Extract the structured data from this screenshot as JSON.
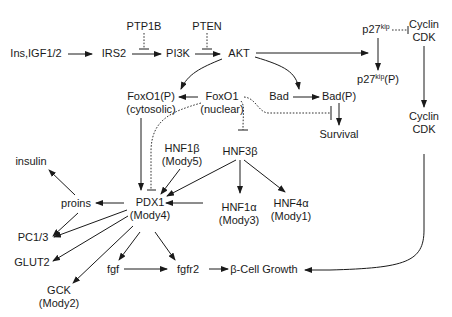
{
  "diagram": {
    "type": "signaling-pathway",
    "nodes": {
      "ins": "Ins,IGF1/2",
      "irs2": "IRS2",
      "ptp1b": "PTP1B",
      "pi3k": "PI3K",
      "pten": "PTEN",
      "akt": "AKT",
      "p27": "p27",
      "p27_sup": "kip",
      "p27p": "p27",
      "p27p_sup": "kip",
      "p27p_suffix": "(P)",
      "cyclin1_line1": "Cyclin",
      "cyclin1_line2": "CDK",
      "foxo1p_line1": "FoxO1(P)",
      "foxo1p_line2": "(cytosolic)",
      "foxo1_line1": "FoxO1",
      "foxo1_line2": "(nuclear)",
      "bad": "Bad",
      "badp": "Bad(P)",
      "survival": "Survival",
      "cyclin2_line1": "Cyclin",
      "cyclin2_line2": "CDK",
      "hnf1b_line1": "HNF1β",
      "hnf1b_line2": "(Mody5)",
      "hnf3b": "HNF3β",
      "insulin": "insulin",
      "proins": "proins",
      "pdx1_line1": "PDX1",
      "pdx1_line2": "(Mody4)",
      "hnf1a_line1": "HNF1α",
      "hnf1a_line2": "(Mody3)",
      "hnf4a_line1": "HNF4α",
      "hnf4a_line2": "(Mody1)",
      "pc13": "PC1/3",
      "glut2": "GLUT2",
      "gck_line1": "GCK",
      "gck_line2": "(Mody2)",
      "fgf": "fgf",
      "fgfr2": "fgfr2",
      "bcell": "β-Cell Growth"
    },
    "edges": [
      {
        "from": "Ins,IGF1/2",
        "to": "IRS2",
        "type": "activation"
      },
      {
        "from": "IRS2",
        "to": "PI3K",
        "type": "activation"
      },
      {
        "from": "PTP1B",
        "to": "IRS2→PI3K",
        "type": "inhibition",
        "style": "dotted"
      },
      {
        "from": "PI3K",
        "to": "AKT",
        "type": "activation"
      },
      {
        "from": "PTEN",
        "to": "PI3K→AKT",
        "type": "inhibition",
        "style": "dotted"
      },
      {
        "from": "AKT",
        "to": "p27kip(P)",
        "type": "activation"
      },
      {
        "from": "p27kip",
        "to": "p27kip(P)",
        "type": "activation"
      },
      {
        "from": "p27kip",
        "to": "Cyclin CDK",
        "type": "inhibition",
        "style": "dotted"
      },
      {
        "from": "Cyclin CDK",
        "to": "Cyclin CDK",
        "type": "activation"
      },
      {
        "from": "AKT",
        "to": "FoxO1(P)",
        "type": "activation"
      },
      {
        "from": "AKT",
        "to": "Bad",
        "type": "activation"
      },
      {
        "from": "FoxO1",
        "to": "FoxO1(P)",
        "type": "activation"
      },
      {
        "from": "Bad",
        "to": "Bad(P)",
        "type": "activation"
      },
      {
        "from": "Bad(P)",
        "to": "Survival",
        "type": "activation"
      },
      {
        "from": "FoxO1",
        "to": "Survival",
        "type": "inhibition",
        "style": "dotted"
      },
      {
        "from": "FoxO1",
        "to": "HNF3β",
        "type": "inhibition",
        "style": "dotted"
      },
      {
        "from": "FoxO1",
        "to": "PDX1",
        "type": "inhibition",
        "style": "dotted"
      },
      {
        "from": "FoxO1(P)",
        "to": "PDX1",
        "type": "activation"
      },
      {
        "from": "HNF1β",
        "to": "PDX1",
        "type": "activation"
      },
      {
        "from": "HNF3β",
        "to": "PDX1",
        "type": "activation"
      },
      {
        "from": "HNF3β",
        "to": "HNF1α",
        "type": "activation"
      },
      {
        "from": "HNF3β",
        "to": "HNF4α",
        "type": "activation"
      },
      {
        "from": "HNF1α",
        "to": "PDX1",
        "type": "activation"
      },
      {
        "from": "PDX1",
        "to": "proins",
        "type": "activation"
      },
      {
        "from": "proins",
        "to": "insulin",
        "type": "activation"
      },
      {
        "from": "proins",
        "to": "PC1/3",
        "type": "activation"
      },
      {
        "from": "PDX1",
        "to": "PC1/3",
        "type": "activation"
      },
      {
        "from": "PDX1",
        "to": "GLUT2",
        "type": "activation"
      },
      {
        "from": "PDX1",
        "to": "GCK",
        "type": "activation"
      },
      {
        "from": "PDX1",
        "to": "fgf",
        "type": "activation"
      },
      {
        "from": "PDX1",
        "to": "fgfr2",
        "type": "activation"
      },
      {
        "from": "fgf",
        "to": "fgfr2",
        "type": "activation"
      },
      {
        "from": "fgfr2",
        "to": "β-Cell Growth",
        "type": "activation"
      },
      {
        "from": "Cyclin CDK",
        "to": "β-Cell Growth",
        "type": "activation"
      }
    ]
  }
}
